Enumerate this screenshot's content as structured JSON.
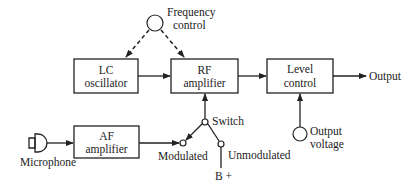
{
  "diagram": {
    "type": "block-diagram",
    "blocks": {
      "lc_oscillator": {
        "line1": "LC",
        "line2": "oscillator"
      },
      "rf_amplifier": {
        "line1": "RF",
        "line2": "amplifier"
      },
      "level_control": {
        "line1": "Level",
        "line2": "control"
      },
      "af_amplifier": {
        "line1": "AF",
        "line2": "amplifier"
      }
    },
    "labels": {
      "frequency_control_1": "Frequency",
      "frequency_control_2": "control",
      "output": "Output",
      "output_voltage_1": "Output",
      "output_voltage_2": "voltage",
      "switch": "Switch",
      "modulated": "Modulated",
      "unmodulated": "Unmodulated",
      "b_plus": "B +",
      "microphone": "Microphone"
    },
    "connections": [
      {
        "from": "Frequency control",
        "to": "LC oscillator",
        "style": "dashed"
      },
      {
        "from": "Frequency control",
        "to": "RF amplifier",
        "style": "dashed"
      },
      {
        "from": "LC oscillator",
        "to": "RF amplifier",
        "style": "solid"
      },
      {
        "from": "RF amplifier",
        "to": "Level control",
        "style": "solid"
      },
      {
        "from": "Level control",
        "to": "Output",
        "style": "solid"
      },
      {
        "from": "Output voltage",
        "to": "Level control",
        "style": "solid"
      },
      {
        "from": "Microphone",
        "to": "AF amplifier",
        "style": "solid"
      },
      {
        "from": "AF amplifier",
        "to": "Modulated",
        "style": "solid"
      },
      {
        "from": "Switch",
        "to": "RF amplifier",
        "style": "solid"
      },
      {
        "from": "Switch",
        "to": "Modulated",
        "style": "solid"
      },
      {
        "from": "Switch",
        "to": "Unmodulated",
        "style": "solid"
      },
      {
        "from": "B +",
        "to": "Unmodulated",
        "style": "solid"
      }
    ]
  }
}
